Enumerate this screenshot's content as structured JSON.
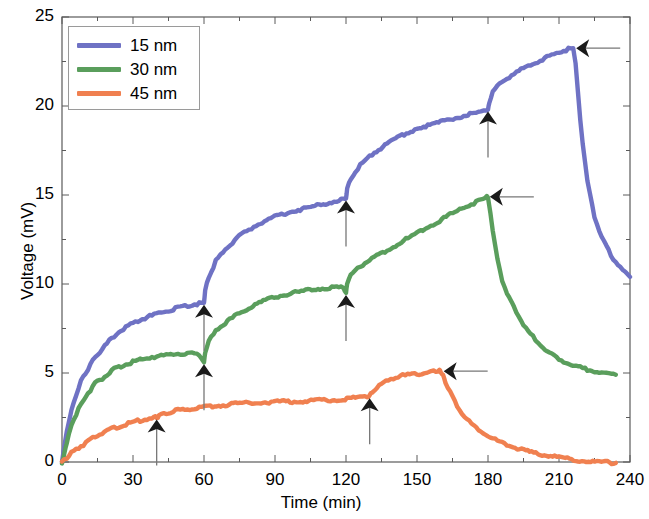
{
  "chart_data": {
    "type": "line",
    "title": "",
    "xlabel": "Time (min)",
    "ylabel": "Voltage (mV)",
    "xlim": [
      0,
      240
    ],
    "ylim": [
      0,
      25
    ],
    "xticks": [
      0,
      30,
      60,
      90,
      120,
      150,
      180,
      210,
      240
    ],
    "yticks": [
      0,
      5,
      10,
      15,
      20,
      25
    ],
    "xtick_labels": [
      "0",
      "30",
      "60",
      "90",
      "120",
      "150",
      "180",
      "210",
      "240"
    ],
    "ytick_labels": [
      "0",
      "5",
      "10",
      "15",
      "20",
      "25"
    ],
    "xminor_step": 15,
    "yminor_step": 2.5,
    "grid": false,
    "legend_position": "upper-left",
    "box": true,
    "colors": {
      "blue": "#6f72c4",
      "green": "#5a9e5c",
      "orange": "#f08050",
      "axis": "#5a5a5a",
      "annotation": "#1a1a1a"
    },
    "series": [
      {
        "name": "15 nm",
        "color": "#6f72c4",
        "x": [
          0,
          1,
          2,
          3,
          4,
          6,
          8,
          10,
          13,
          16,
          20,
          25,
          30,
          35,
          40,
          45,
          50,
          55,
          58,
          60,
          60.5,
          62,
          65,
          70,
          76,
          82,
          90,
          98,
          106,
          114,
          119,
          120,
          120.5,
          122,
          126,
          132,
          140,
          150,
          160,
          168,
          175,
          179,
          180,
          180.5,
          182,
          186,
          192,
          198,
          204,
          210,
          214,
          216,
          217,
          218,
          219,
          220,
          222,
          225,
          228,
          232,
          236,
          240
        ],
        "y": [
          0.0,
          0.9,
          1.7,
          2.3,
          2.9,
          3.8,
          4.5,
          5.0,
          5.7,
          6.2,
          6.8,
          7.4,
          7.8,
          8.1,
          8.3,
          8.5,
          8.7,
          8.85,
          8.9,
          8.95,
          9.6,
          10.4,
          11.3,
          12.1,
          12.8,
          13.3,
          13.8,
          14.1,
          14.35,
          14.6,
          14.75,
          14.8,
          15.3,
          15.9,
          16.7,
          17.4,
          18.1,
          18.75,
          19.1,
          19.4,
          19.6,
          19.75,
          19.8,
          20.2,
          20.8,
          21.4,
          21.9,
          22.3,
          22.7,
          23.0,
          23.2,
          23.25,
          22.4,
          20.8,
          19.2,
          17.9,
          15.8,
          13.8,
          12.6,
          11.6,
          10.9,
          10.4
        ]
      },
      {
        "name": "30 nm",
        "color": "#5a9e5c",
        "x": [
          0,
          1,
          2,
          3,
          5,
          7,
          10,
          14,
          18,
          22,
          27,
          32,
          38,
          44,
          50,
          55,
          58,
          60,
          60.5,
          62,
          66,
          72,
          78,
          86,
          94,
          102,
          110,
          116,
          119,
          120,
          120.5,
          122,
          126,
          132,
          140,
          148,
          156,
          164,
          170,
          175,
          178,
          179.5,
          180,
          181,
          182,
          184,
          186,
          189,
          192,
          196,
          200,
          205,
          210,
          216,
          222,
          228,
          234
        ],
        "y": [
          0.0,
          0.5,
          1.1,
          1.6,
          2.4,
          3.0,
          3.7,
          4.4,
          4.8,
          5.2,
          5.5,
          5.7,
          5.9,
          6.0,
          6.1,
          6.1,
          6.05,
          5.6,
          6.2,
          6.8,
          7.5,
          8.1,
          8.6,
          9.1,
          9.4,
          9.6,
          9.75,
          9.8,
          9.8,
          9.5,
          10.1,
          10.5,
          11.0,
          11.5,
          12.1,
          12.7,
          13.3,
          13.9,
          14.3,
          14.6,
          14.8,
          14.9,
          14.85,
          14.0,
          13.0,
          11.4,
          10.2,
          9.2,
          8.4,
          7.5,
          6.9,
          6.2,
          5.8,
          5.4,
          5.2,
          5.0,
          4.9
        ]
      },
      {
        "name": "45 nm",
        "color": "#f08050",
        "x": [
          0,
          2,
          4,
          7,
          11,
          15,
          20,
          25,
          30,
          35,
          39,
          40,
          41,
          44,
          48,
          54,
          60,
          68,
          76,
          84,
          92,
          100,
          108,
          116,
          124,
          129,
          130,
          131,
          134,
          138,
          144,
          150,
          155,
          158,
          159.5,
          160,
          161,
          162,
          164,
          167,
          171,
          176,
          182,
          188,
          195,
          202,
          210,
          218,
          226,
          234
        ],
        "y": [
          0.0,
          0.25,
          0.5,
          0.8,
          1.15,
          1.5,
          1.8,
          2.05,
          2.25,
          2.4,
          2.5,
          2.5,
          2.6,
          2.75,
          2.9,
          3.0,
          3.1,
          3.2,
          3.3,
          3.35,
          3.4,
          3.4,
          3.45,
          3.5,
          3.6,
          3.7,
          3.7,
          3.9,
          4.3,
          4.65,
          4.85,
          4.95,
          5.05,
          5.1,
          5.12,
          5.1,
          4.85,
          4.5,
          3.9,
          3.1,
          2.4,
          1.8,
          1.3,
          0.95,
          0.65,
          0.45,
          0.25,
          0.1,
          0.0,
          -0.05
        ]
      }
    ],
    "annotations": [
      {
        "label": "down-arrow",
        "style": "down",
        "x": 60,
        "y": 8.95,
        "series": "15 nm"
      },
      {
        "label": "down-arrow",
        "style": "down",
        "x": 120,
        "y": 14.8,
        "series": "15 nm"
      },
      {
        "label": "down-arrow",
        "style": "down",
        "x": 180,
        "y": 19.8,
        "series": "15 nm"
      },
      {
        "label": "left-arrow",
        "style": "left",
        "x": 216,
        "y": 23.25,
        "series": "15 nm"
      },
      {
        "label": "down-arrow",
        "style": "down",
        "x": 60,
        "y": 5.6,
        "series": "30 nm"
      },
      {
        "label": "down-arrow",
        "style": "down",
        "x": 120,
        "y": 9.5,
        "series": "30 nm"
      },
      {
        "label": "left-arrow",
        "style": "left",
        "x": 179.5,
        "y": 14.9,
        "series": "30 nm"
      },
      {
        "label": "down-arrow",
        "style": "down",
        "x": 40,
        "y": 2.5,
        "series": "45 nm"
      },
      {
        "label": "down-arrow",
        "style": "down",
        "x": 130,
        "y": 3.7,
        "series": "45 nm"
      },
      {
        "label": "left-arrow",
        "style": "left",
        "x": 160,
        "y": 5.1,
        "series": "45 nm"
      }
    ]
  },
  "legend": {
    "entries": [
      {
        "label": "15 nm",
        "color": "#6f72c4"
      },
      {
        "label": "30 nm",
        "color": "#5a9e5c"
      },
      {
        "label": "45 nm",
        "color": "#f08050"
      }
    ]
  },
  "axes": {
    "xlabel": "Time (min)",
    "ylabel": "Voltage (mV)"
  }
}
